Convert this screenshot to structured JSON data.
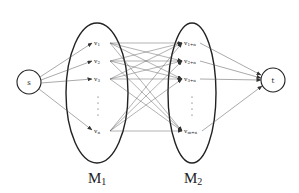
{
  "diagram": {
    "source": {
      "label": "s"
    },
    "sink": {
      "label": "t"
    },
    "sets": [
      {
        "label_main": "M",
        "label_sub": "1",
        "nodes": [
          {
            "main": "v",
            "sub": "1"
          },
          {
            "main": "v",
            "sub": "2"
          },
          {
            "main": "v",
            "sub": "3"
          },
          {
            "main": "v",
            "sub": "n"
          }
        ],
        "ellipsis": "⋮"
      },
      {
        "label_main": "M",
        "label_sub": "2",
        "nodes": [
          {
            "main": "v",
            "sub": "1+n"
          },
          {
            "main": "v",
            "sub": "2+n"
          },
          {
            "main": "v",
            "sub": "3+n"
          },
          {
            "main": "v",
            "sub": "m+n"
          }
        ],
        "ellipsis": "⋮"
      }
    ],
    "edges": "s → each v in M1; each v in M1 → each v in M2 (complete bipartite); each v in M2 → t"
  }
}
